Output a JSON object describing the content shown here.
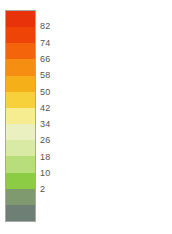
{
  "legend": {
    "orientation": "vertical",
    "label_side": "right",
    "border_color": "#a8a8a8",
    "background": "#ffffff",
    "text_color": "#54544f"
  },
  "chart_data": {
    "type": "heatmap",
    "title": "",
    "subtitle": "",
    "xlabel": "",
    "ylabel": "",
    "legend_position": "right",
    "grid": false,
    "colorbar": {
      "orientation": "vertical",
      "tick_labels": [
        "82",
        "74",
        "66",
        "58",
        "50",
        "42",
        "34",
        "26",
        "18",
        "10",
        "2"
      ],
      "tick_values": [
        82,
        74,
        66,
        58,
        50,
        42,
        34,
        26,
        18,
        10,
        2
      ],
      "interval": 8,
      "vmin": 2,
      "vmax": 82,
      "band_count": 12,
      "bands": [
        {
          "index": 0,
          "color": "#e8330a",
          "range_label": "above 82"
        },
        {
          "index": 1,
          "color": "#ef4408",
          "range_label": "74 - 82"
        },
        {
          "index": 2,
          "color": "#f4650b",
          "range_label": "66 - 74"
        },
        {
          "index": 3,
          "color": "#f68e12",
          "range_label": "58 - 66"
        },
        {
          "index": 4,
          "color": "#f5b019",
          "range_label": "50 - 58"
        },
        {
          "index": 5,
          "color": "#f6d13c",
          "range_label": "42 - 50"
        },
        {
          "index": 6,
          "color": "#f6ec90",
          "range_label": "34 - 42"
        },
        {
          "index": 7,
          "color": "#eaf0c0",
          "range_label": "26 - 34"
        },
        {
          "index": 8,
          "color": "#d8eaa4",
          "range_label": "18 - 26"
        },
        {
          "index": 9,
          "color": "#b7de7a",
          "range_label": "10 - 18"
        },
        {
          "index": 10,
          "color": "#8ccb44",
          "range_label": "2 - 10"
        },
        {
          "index": 11,
          "color": "#7e9a6e",
          "range_label": "below 2"
        },
        {
          "index": 12,
          "color": "#6e7f75",
          "range_label": "no data"
        }
      ]
    }
  }
}
